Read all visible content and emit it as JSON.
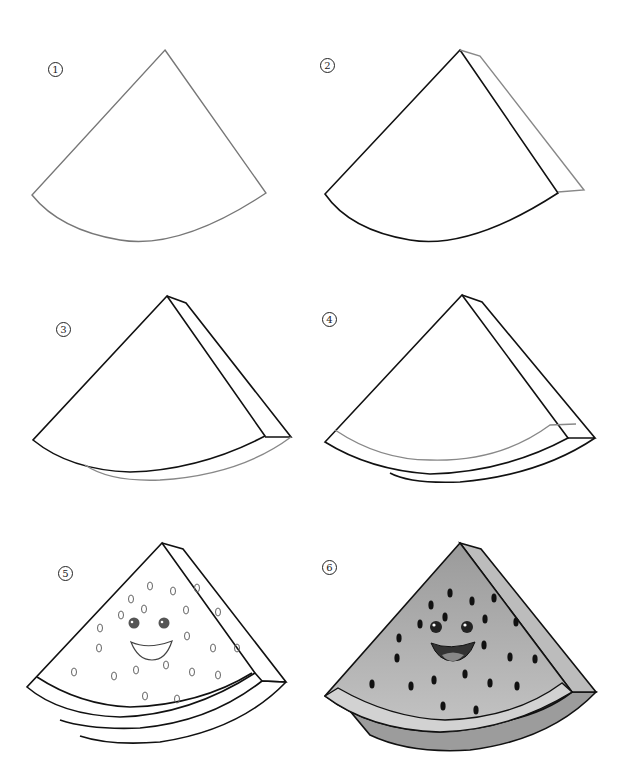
{
  "colors": {
    "background": "#ffffff",
    "line_dark": "#111111",
    "line_light": "#777777",
    "flesh_fill": "#a9a9a9",
    "rind_fill": "#c9c9c9",
    "side_fill": "#bdbdbd",
    "seed_fill": "#111111"
  },
  "steps": [
    {
      "number": "1",
      "label": "Draw the slice outline"
    },
    {
      "number": "2",
      "label": "Add the thickness on the right side"
    },
    {
      "number": "3",
      "label": "Add the bottom thickness"
    },
    {
      "number": "4",
      "label": "Draw the rind line"
    },
    {
      "number": "5",
      "label": "Add seeds and a cute face"
    },
    {
      "number": "6",
      "label": "Color the watermelon"
    }
  ]
}
